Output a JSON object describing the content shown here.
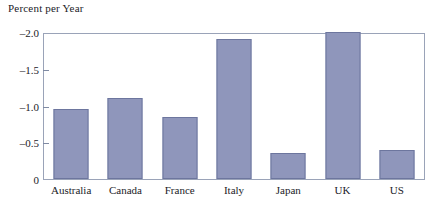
{
  "chart_data": {
    "type": "bar",
    "title": "Percent per Year",
    "xlabel": "",
    "ylabel": "Percent per Year",
    "categories": [
      "Australia",
      "Canada",
      "France",
      "Italy",
      "Japan",
      "UK",
      "US"
    ],
    "values": [
      -0.95,
      -1.1,
      -0.85,
      -1.9,
      -0.35,
      -2.0,
      -0.4
    ],
    "ytick_labels": [
      "-2.0",
      "-1.5",
      "-1.0",
      "-0.5",
      "0"
    ],
    "ytick_values": [
      -2.0,
      -1.5,
      -1.0,
      -0.5,
      0
    ],
    "ylim": [
      0,
      -2.0
    ],
    "axis_inverted": true,
    "grid": false,
    "legend": "none",
    "bar_color": "#8f96bb",
    "bar_edge_color": "#6d769e",
    "frame_color": "#9aa3b8",
    "text_color": "#1b1b28"
  }
}
